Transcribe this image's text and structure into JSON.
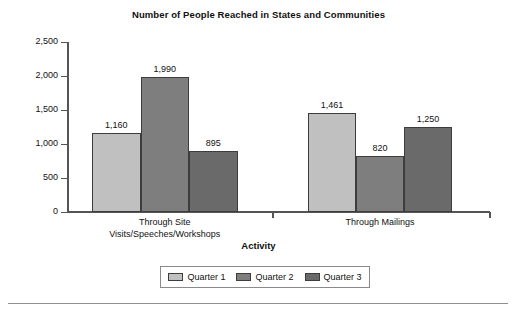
{
  "chart_data": {
    "type": "bar",
    "title": "Number of People Reached in States and Communities",
    "xlabel": "Activity",
    "ylabel": "",
    "categories": [
      "Through Site Visits/Speeches/Workshops",
      "Through Mailings"
    ],
    "category_lines": [
      [
        "Through Site",
        "Visits/Speeches/Workshops"
      ],
      [
        "Through Mailings"
      ]
    ],
    "series": [
      {
        "name": "Quarter 1",
        "values": [
          1160,
          1461
        ],
        "labels": [
          "1,160",
          "1,461"
        ],
        "color": "#c0c0c0"
      },
      {
        "name": "Quarter 2",
        "values": [
          1990,
          820
        ],
        "labels": [
          "1,990",
          "820"
        ],
        "color": "#7e7e7e"
      },
      {
        "name": "Quarter 3",
        "values": [
          895,
          1250
        ],
        "labels": [
          "895",
          "1,250"
        ],
        "color": "#6a6a6a"
      }
    ],
    "ylim": [
      0,
      2500
    ],
    "yticks": [
      0,
      500,
      1000,
      1500,
      2000,
      2500
    ],
    "ytick_labels": [
      "0",
      "500",
      "1,000",
      "1,500",
      "2,000",
      "2,500"
    ],
    "grid": false,
    "legend_position": "bottom",
    "bar_border_color": "#3d3d3d",
    "axis_color": "#555555"
  },
  "legend": {
    "items": [
      {
        "label": "Quarter 1",
        "color": "#c0c0c0"
      },
      {
        "label": "Quarter 2",
        "color": "#7e7e7e"
      },
      {
        "label": "Quarter 3",
        "color": "#6a6a6a"
      }
    ]
  }
}
